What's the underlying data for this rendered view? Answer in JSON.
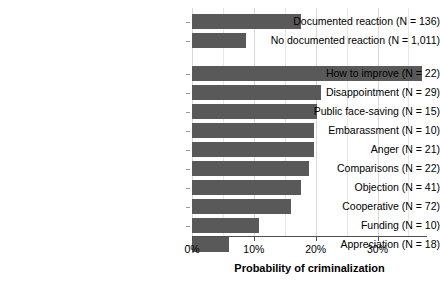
{
  "chart_data": {
    "type": "bar",
    "orientation": "horizontal",
    "title": "",
    "xlabel": "Probability of criminalization",
    "ylabel": "",
    "xlim": [
      0,
      38
    ],
    "xticks": [
      0,
      10,
      20,
      30
    ],
    "xtick_labels": [
      "0%",
      "10%",
      "20%",
      "30%"
    ],
    "grid": true,
    "grid_axis": "x",
    "minor_gridlines": [
      5,
      15,
      25,
      35
    ],
    "legend": null,
    "bar_color": "#595959",
    "groups": [
      {
        "name": "documentation-group",
        "categories": [
          "Documented reaction (N = 136)",
          "No documented reaction (N = 1,011)"
        ],
        "values": [
          17.7,
          8.7
        ],
        "counts": [
          136,
          1011
        ]
      },
      {
        "name": "reaction-type-group",
        "categories": [
          "How to improve (N = 22)",
          "Disappointment (N = 29)",
          "Public face-saving (N = 15)",
          "Embarassment (N = 10)",
          "Anger (N = 21)",
          "Comparisons (N = 22)",
          "Objection (N = 41)",
          "Cooperative (N = 72)",
          "Funding (N = 10)",
          "Appreciation (N = 18)"
        ],
        "values": [
          37.2,
          20.8,
          20.2,
          19.7,
          19.7,
          18.9,
          17.7,
          16.0,
          10.8,
          6.0
        ],
        "counts": [
          22,
          29,
          15,
          10,
          21,
          22,
          41,
          72,
          10,
          18
        ]
      }
    ]
  }
}
